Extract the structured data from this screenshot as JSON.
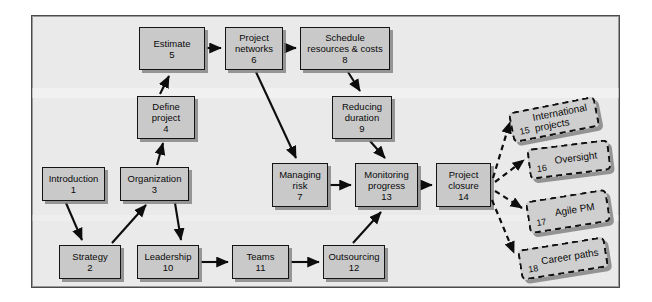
{
  "diagram": {
    "frame": {
      "background": "#eaeaea",
      "border_color": "#4a4a4a"
    },
    "node_style": {
      "fill": "#c9c9c9",
      "stroke": "#141414",
      "shadow": "#787878"
    },
    "dashed_style": {
      "fill": "#cfcfcf",
      "stroke": "#111111",
      "dash": "dashed"
    },
    "nodes": [
      {
        "id": "n1",
        "label": "Introduction",
        "num": "1",
        "x": 42,
        "y": 167,
        "w": 63,
        "h": 34
      },
      {
        "id": "n2",
        "label": "Strategy",
        "num": "2",
        "x": 59,
        "y": 245,
        "w": 62,
        "h": 34
      },
      {
        "id": "n3",
        "label": "Organization",
        "num": "3",
        "x": 120,
        "y": 167,
        "w": 69,
        "h": 34
      },
      {
        "id": "n4",
        "label": "Define\nproject",
        "num": "4",
        "x": 137,
        "y": 96,
        "w": 58,
        "h": 43
      },
      {
        "id": "n5",
        "label": "Estimate",
        "num": "5",
        "x": 139,
        "y": 27,
        "w": 66,
        "h": 43
      },
      {
        "id": "n6",
        "label": "Project\nnetworks",
        "num": "6",
        "x": 225,
        "y": 27,
        "w": 58,
        "h": 43
      },
      {
        "id": "n7",
        "label": "Managing\nrisk",
        "num": "7",
        "x": 272,
        "y": 163,
        "w": 56,
        "h": 44
      },
      {
        "id": "n8",
        "label": "Schedule\nresources & costs",
        "num": "8",
        "x": 300,
        "y": 27,
        "w": 90,
        "h": 43
      },
      {
        "id": "n9",
        "label": "Reducing\nduration",
        "num": "9",
        "x": 332,
        "y": 96,
        "w": 60,
        "h": 43
      },
      {
        "id": "n10",
        "label": "Leadership",
        "num": "10",
        "x": 137,
        "y": 245,
        "w": 62,
        "h": 34
      },
      {
        "id": "n11",
        "label": "Teams",
        "num": "11",
        "x": 232,
        "y": 245,
        "w": 57,
        "h": 34
      },
      {
        "id": "n12",
        "label": "Outsourcing",
        "num": "12",
        "x": 323,
        "y": 245,
        "w": 62,
        "h": 34
      },
      {
        "id": "n13",
        "label": "Monitoring\nprogress",
        "num": "13",
        "x": 355,
        "y": 163,
        "w": 63,
        "h": 44
      },
      {
        "id": "n14",
        "label": "Project\nclosure",
        "num": "14",
        "x": 436,
        "y": 163,
        "w": 55,
        "h": 44
      }
    ],
    "dashed_nodes": [
      {
        "id": "d15",
        "label": "International\nprojects",
        "num": "15",
        "x": 510,
        "y": 104,
        "w": 88,
        "h": 31,
        "rotate": -11
      },
      {
        "id": "d16",
        "label": "Oversight",
        "num": "16",
        "x": 528,
        "y": 144,
        "w": 82,
        "h": 31,
        "rotate": -7
      },
      {
        "id": "d17",
        "label": "Agile PM",
        "num": "17",
        "x": 527,
        "y": 195,
        "w": 82,
        "h": 33,
        "rotate": -9
      },
      {
        "id": "d18",
        "label": "Career paths",
        "num": "18",
        "x": 519,
        "y": 243,
        "w": 88,
        "h": 31,
        "rotate": -9
      }
    ],
    "solid_edges": [
      {
        "from": "n1",
        "to": "n2"
      },
      {
        "from": "n2",
        "to": "n3"
      },
      {
        "from": "n3",
        "to": "n4"
      },
      {
        "from": "n3",
        "to": "n10"
      },
      {
        "from": "n4",
        "to": "n5"
      },
      {
        "from": "n5",
        "to": "n6"
      },
      {
        "from": "n6",
        "to": "n8"
      },
      {
        "from": "n6",
        "to": "n7"
      },
      {
        "from": "n8",
        "to": "n9"
      },
      {
        "from": "n9",
        "to": "n13"
      },
      {
        "from": "n7",
        "to": "n13"
      },
      {
        "from": "n10",
        "to": "n11"
      },
      {
        "from": "n11",
        "to": "n12"
      },
      {
        "from": "n12",
        "to": "n13"
      },
      {
        "from": "n13",
        "to": "n14"
      }
    ],
    "dashed_edges": [
      {
        "from": "n14",
        "to": "d15"
      },
      {
        "from": "n14",
        "to": "d16"
      },
      {
        "from": "n14",
        "to": "d17"
      },
      {
        "from": "n14",
        "to": "d18"
      }
    ]
  }
}
